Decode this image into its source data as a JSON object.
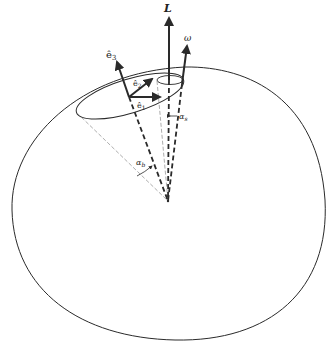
{
  "diagram": {
    "type": "rigid-body-precession",
    "labels": {
      "angular_momentum": "L",
      "angular_velocity": "ω",
      "axis_e3": "ê",
      "axis_e3_sub": "3",
      "axis_e2": "ê",
      "axis_e2_sub": "2",
      "axis_e1": "ê",
      "axis_e1_sub": "1",
      "body_cone_angle": "α",
      "body_cone_angle_sub": "b",
      "space_cone_angle": "α",
      "space_cone_angle_sub": "s"
    },
    "colors": {
      "stroke": "#2a2a2a",
      "light_stroke": "#8a8a8a",
      "background": "#ffffff"
    }
  }
}
